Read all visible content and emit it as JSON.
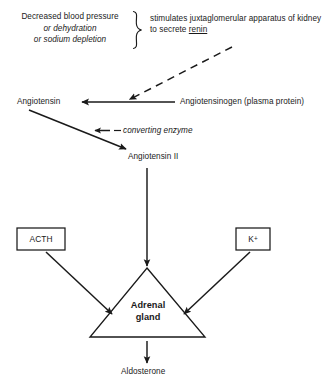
{
  "diagram": {
    "stroke_color": "#1a1a1a",
    "text_color": "#1a1a1a",
    "background_color": "#ffffff"
  },
  "trigger": {
    "line1": "Decreased blood pressure",
    "line2": "or dehydration",
    "line3": "or sodium depletion",
    "brace": "}"
  },
  "renin": {
    "text_before": "stimulates juxtaglomerular apparatus of kidney to secrete ",
    "underlined_word": "renin"
  },
  "nodes": {
    "angiotensin": "Angiotensin",
    "angiotensinogen": "Angiotensinogen (plasma protein)",
    "converting_enzyme": "converting enzyme",
    "angiotensin_ii": "Angiotensin II",
    "acth": "ACTH",
    "potassium": "K",
    "potassium_charge": "+",
    "adrenal_line1": "Adrenal",
    "adrenal_line2": "gland",
    "aldosterone": "Aldosterone"
  },
  "connectors": {
    "renin_dashed_arrow": "dashed-arrow-renin-to-angiotensin",
    "angiotensinogen_arrow": "arrow-angiotensinogen-to-angiotensin",
    "angiotensin_to_ii": "arrow-angiotensin-to-angiotensin-ii",
    "enzyme_arrow": "arrow-converting-enzyme",
    "ii_to_adrenal": "arrow-angiotensin-ii-to-adrenal-gland",
    "acth_to_adrenal": "arrow-acth-to-adrenal-gland",
    "k_to_adrenal": "arrow-potassium-to-adrenal-gland",
    "adrenal_to_aldosterone": "arrow-adrenal-gland-to-aldosterone"
  }
}
